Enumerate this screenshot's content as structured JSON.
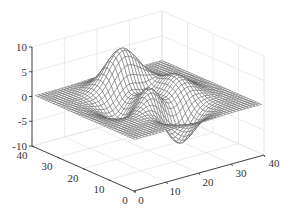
{
  "chart_data": {
    "type": "surface-mesh",
    "title": "",
    "function": "peaks",
    "formula": "z = 3(1-x)^2 e^{-x^2-(y+1)^2} - 10(x/5 - x^3 - y^5) e^{-x^2-y^2} - 1/3 e^{-(x+1)^2-y^2}",
    "grid": {
      "n": 40,
      "domain": [
        -3,
        3
      ]
    },
    "xlabel": "",
    "ylabel": "",
    "zlabel": "",
    "x_ticks": [
      "0",
      "10",
      "20",
      "30",
      "40"
    ],
    "y_ticks": [
      "0",
      "10",
      "20",
      "30",
      "40"
    ],
    "z_ticks": [
      "10",
      "5",
      "0",
      "-5",
      "-10"
    ],
    "xlim": [
      0,
      40
    ],
    "ylim": [
      0,
      40
    ],
    "zlim": [
      -10,
      10
    ],
    "z_range_approx": [
      -6.5,
      8.1
    ],
    "grid_on": true,
    "legend": null,
    "mesh_color": "#555555",
    "face_color": "#ffffff",
    "gridline_color": "#e6e6e6",
    "axis_color": "#333333"
  }
}
